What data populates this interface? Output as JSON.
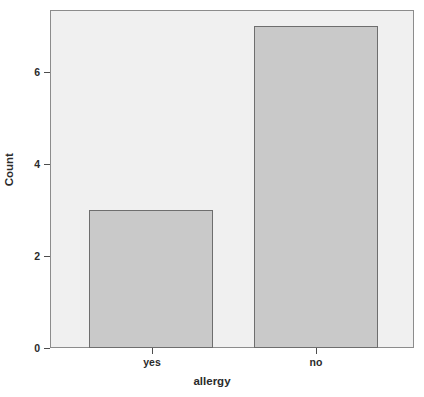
{
  "chart_data": {
    "type": "bar",
    "title": "",
    "subtitle": "",
    "xlabel": "allergy",
    "ylabel": "Count",
    "categories": [
      "yes",
      "no"
    ],
    "values": [
      3,
      7
    ],
    "series": [
      {
        "name": "Count",
        "values": [
          3,
          7
        ]
      }
    ],
    "ylim": [
      0,
      7.35
    ],
    "y_ticks": [
      0,
      2,
      4,
      6
    ],
    "y_tick_labels": [
      "0",
      "2",
      "4",
      "6"
    ],
    "x_tick_labels": [
      "yes",
      "no"
    ],
    "grid": false,
    "legend": null,
    "legend_position": "none",
    "annotations": [],
    "colors": {
      "bar_fill": "#c9c9c9",
      "bar_border": "#6e6e6e",
      "panel_background": "#f0f0f0",
      "panel_border": "#8c8c8c",
      "axis_text": "#2b2b2b",
      "figure_background": "#ffffff"
    }
  },
  "axis": {
    "y_title": "Count",
    "x_title": "allergy",
    "y_tick_0": "0",
    "y_tick_1": "2",
    "y_tick_2": "4",
    "y_tick_3": "6",
    "x_tick_0": "yes",
    "x_tick_1": "no"
  }
}
